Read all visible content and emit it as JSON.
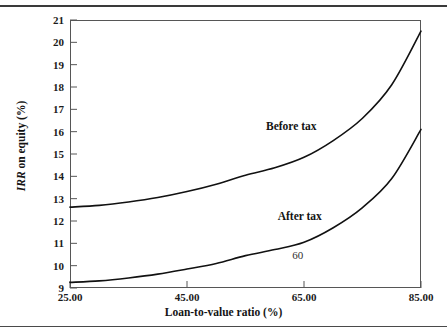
{
  "figure": {
    "background": "#ffffff",
    "frame_color": "#565656",
    "curve_color": "#111111",
    "rule_top": true,
    "rule_bottom": true
  },
  "chart_data": {
    "type": "line",
    "title": "",
    "xlabel": "Loan-to-value ratio (%)",
    "ylabel": "IRR on equity (%)",
    "ylabel_italic_part": "IRR",
    "ylabel_rest": " on equity (%)",
    "xlim": [
      25,
      85
    ],
    "ylim": [
      9,
      21
    ],
    "grid": false,
    "legend_position": "inline-annotations",
    "xticks": [
      25,
      45,
      65,
      85
    ],
    "xtick_labels": [
      "25.00",
      "45.00",
      "65.00",
      "85.00"
    ],
    "yticks": [
      9,
      10,
      11,
      12,
      13,
      14,
      15,
      16,
      17,
      18,
      19,
      20,
      21
    ],
    "ytick_labels": [
      "9",
      "10",
      "11",
      "12",
      "13",
      "14",
      "15",
      "16",
      "17",
      "18",
      "19",
      "20",
      "21"
    ],
    "series": [
      {
        "name": "Before tax",
        "x": [
          25,
          30,
          35,
          40,
          45,
          50,
          55,
          60,
          65,
          70,
          75,
          80,
          85
        ],
        "values": [
          12.62,
          12.7,
          12.85,
          13.05,
          13.32,
          13.65,
          14.05,
          14.38,
          14.85,
          15.6,
          16.6,
          18.1,
          20.5
        ]
      },
      {
        "name": "After tax",
        "x": [
          25,
          30,
          35,
          40,
          45,
          50,
          55,
          60,
          65,
          70,
          75,
          80,
          85
        ],
        "values": [
          9.25,
          9.32,
          9.45,
          9.62,
          9.85,
          10.1,
          10.45,
          10.72,
          11.05,
          11.7,
          12.6,
          13.9,
          16.1
        ]
      }
    ],
    "annotations": [
      {
        "text": "Before tax",
        "x": 58.5,
        "y": 16.2
      },
      {
        "text": "After tax",
        "x": 60.5,
        "y": 12.2
      },
      {
        "text": "60",
        "x": 63.0,
        "y": 10.45
      }
    ]
  }
}
